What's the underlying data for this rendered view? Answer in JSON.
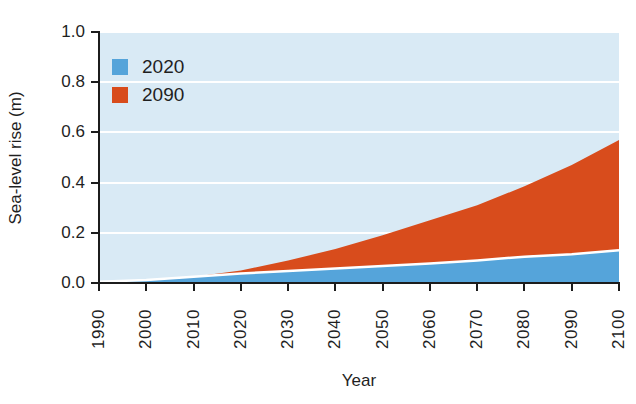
{
  "chart_data": {
    "type": "area",
    "title": "",
    "xlabel": "Year",
    "ylabel": "Sea-level rise (m)",
    "x": [
      1990,
      2000,
      2010,
      2020,
      2030,
      2040,
      2050,
      2060,
      2070,
      2080,
      2090,
      2100
    ],
    "series": [
      {
        "name": "2020",
        "color": "#55A4DA",
        "values": [
          0.005,
          0.012,
          0.025,
          0.038,
          0.048,
          0.058,
          0.068,
          0.078,
          0.09,
          0.105,
          0.115,
          0.13
        ]
      },
      {
        "name": "2090",
        "color": "#D84C1C",
        "values": [
          0.005,
          0.012,
          0.025,
          0.05,
          0.09,
          0.135,
          0.19,
          0.25,
          0.31,
          0.385,
          0.47,
          0.57
        ]
      }
    ],
    "xlim": [
      1990,
      2100
    ],
    "ylim": [
      0,
      1.0
    ],
    "xticks": [
      1990,
      2000,
      2010,
      2020,
      2030,
      2040,
      2050,
      2060,
      2070,
      2080,
      2090,
      2100
    ],
    "yticks": [
      0.0,
      0.2,
      0.4,
      0.6,
      0.8,
      1.0
    ],
    "ytick_labels": [
      "0.0",
      "0.2",
      "0.4",
      "0.6",
      "0.8",
      "1.0"
    ],
    "grid": true,
    "grid_color": "#ffffff",
    "plot_bg": "#D9EAF5",
    "axis_color": "#1c1c1c",
    "separator_color": "#ffffff",
    "legend_position": "top-left",
    "legend_entries": [
      "2020",
      "2090"
    ]
  }
}
